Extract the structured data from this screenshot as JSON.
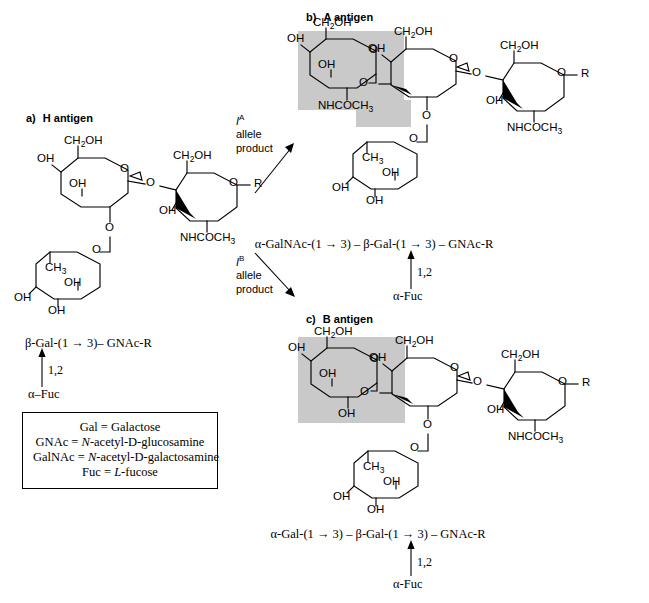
{
  "figure": {
    "title_hidden": "ABO blood group antigen structures",
    "accent_gray": "#c9c9c9",
    "ink": "#000000",
    "background": "#ffffff"
  },
  "panels": [
    {
      "letter": "a)",
      "title": "H antigen",
      "sequence": {
        "main": "β-Gal-(1 → 3)– GNAc-R",
        "branch_label": "1,2",
        "branch_residue": "α–Fuc"
      },
      "sugars": [
        {
          "name": "beta-galactose",
          "labels": [
            "OH",
            "CH2OH",
            "O",
            "OH",
            "O"
          ]
        },
        {
          "name": "gnac",
          "labels": [
            "CH2OH",
            "O",
            "R",
            "OH",
            "NHCOCH3"
          ]
        },
        {
          "name": "alpha-fucose",
          "labels": [
            "O",
            "CH3",
            "OH",
            "OH",
            "OH"
          ]
        }
      ]
    },
    {
      "letter": "b)",
      "title": "A antigen",
      "sequence": {
        "main": "α-GalNAc-(1 → 3) – β-Gal-(1 → 3) – GNAc-R",
        "branch_label": "1,2",
        "branch_residue": "α-Fuc"
      },
      "highlight": "alpha-GalNAc terminal residue",
      "sugars": [
        {
          "name": "alpha-galnac",
          "labels": [
            "OH",
            "CH2OH",
            "O",
            "OH",
            "O",
            "NHCOCH3"
          ]
        },
        {
          "name": "beta-galactose",
          "labels": [
            "OH",
            "CH2OH",
            "O",
            "O",
            "O"
          ]
        },
        {
          "name": "gnac",
          "labels": [
            "CH2OH",
            "O",
            "R",
            "OH",
            "NHCOCH3"
          ]
        },
        {
          "name": "alpha-fucose",
          "labels": [
            "O",
            "CH3",
            "OH",
            "OH",
            "OH"
          ]
        }
      ]
    },
    {
      "letter": "c)",
      "title": "B antigen",
      "sequence": {
        "main": "α-Gal-(1 → 3) – β-Gal-(1 → 3) – GNAc-R",
        "branch_label": "1,2",
        "branch_residue": "α-Fuc"
      },
      "highlight": "alpha-Gal terminal residue",
      "sugars": [
        {
          "name": "alpha-galactose",
          "labels": [
            "OH",
            "CH2OH",
            "O",
            "OH",
            "O",
            "OH"
          ]
        },
        {
          "name": "beta-galactose",
          "labels": [
            "OH",
            "CH2OH",
            "O",
            "O",
            "O"
          ]
        },
        {
          "name": "gnac",
          "labels": [
            "CH2OH",
            "O",
            "R",
            "OH",
            "NHCOCH3"
          ]
        },
        {
          "name": "alpha-fucose",
          "labels": [
            "O",
            "CH3",
            "OH",
            "OH",
            "OH"
          ]
        }
      ]
    }
  ],
  "arrows": [
    {
      "id": "ia",
      "gene": "I",
      "superscript": "A",
      "line2": "allele",
      "line3": "product"
    },
    {
      "id": "ib",
      "gene": "I",
      "superscript": "B",
      "line2": "allele",
      "line3": "product"
    }
  ],
  "legend": {
    "rows": [
      {
        "abbr": "Gal",
        "eq": "=",
        "full_plain": "Galactose",
        "full_italic": "",
        "full_rest": ""
      },
      {
        "abbr": "GNAc",
        "eq": "=",
        "full_plain": "",
        "full_italic": "N",
        "full_rest": "-acetyl-D-glucosamine"
      },
      {
        "abbr": "GalNAc",
        "eq": "=",
        "full_plain": "",
        "full_italic": "N",
        "full_rest": "-acetyl-D-galactosamine"
      },
      {
        "abbr": "Fuc",
        "eq": "=",
        "full_plain": "",
        "full_italic": "L",
        "full_rest": "-fucose"
      }
    ]
  },
  "atom_labels": {
    "OH": "OH",
    "O": "O",
    "R": "R",
    "CH2OH_pre": "CH",
    "CH2OH_sub": "2",
    "CH2OH_post": "OH",
    "CH3_pre": "CH",
    "CH3_sub": "3",
    "NHCOCH3_pre": "NHCOCH",
    "NHCOCH3_sub": "3"
  }
}
